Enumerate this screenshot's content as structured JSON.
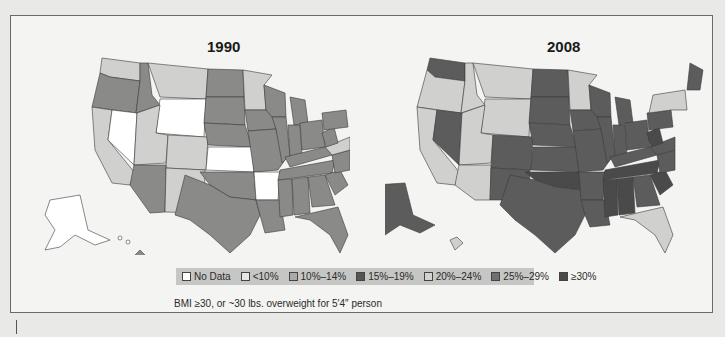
{
  "maps": [
    {
      "title": "1990"
    },
    {
      "title": "2008"
    }
  ],
  "legend": {
    "items": [
      {
        "label": "No Data",
        "color": "#ffffff"
      },
      {
        "label": "<10%",
        "color": "#e6e6e4"
      },
      {
        "label": "10%–14%",
        "color": "#a9a9a7"
      },
      {
        "label": "15%–19%",
        "color": "#555555"
      },
      {
        "label": "20%–24%",
        "color": "#d2d2d0"
      },
      {
        "label": "25%–29%",
        "color": "#6f6f6f"
      },
      {
        "label": "≥30%",
        "color": "#4a4a4a"
      }
    ]
  },
  "caption": "BMI ≥30, or ~30 lbs. overweight for 5′4″ person",
  "colors": {
    "nodata": "#ffffff",
    "light": "#d0d0ce",
    "mid": "#8a8a88",
    "dark": "#5c5c5c",
    "darkest": "#4a4a4a"
  }
}
